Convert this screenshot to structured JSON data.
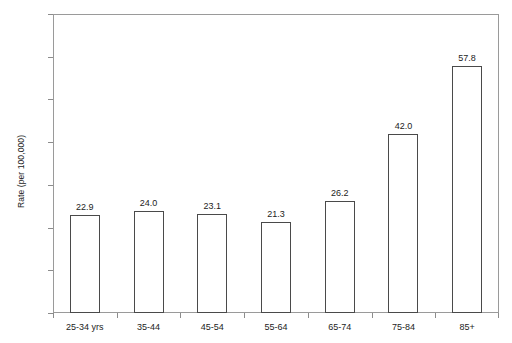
{
  "chart_data": {
    "type": "bar",
    "title": "",
    "xlabel": "",
    "ylabel": "Rate (per 100,000)",
    "categories": [
      "25-34 yrs",
      "35-44",
      "45-54",
      "55-64",
      "65-74",
      "75-84",
      "85+"
    ],
    "values": [
      22.9,
      24.0,
      23.1,
      21.3,
      26.2,
      42.0,
      57.8
    ],
    "value_labels": [
      "22.9",
      "24.0",
      "23.1",
      "21.3",
      "26.2",
      "42.0",
      "57.8"
    ],
    "ylim": [
      0.0,
      70.0
    ],
    "ytick_values": [
      0.0,
      10.0,
      20.0,
      30.0,
      40.0,
      50.0,
      60.0,
      70.0
    ],
    "ytick_labels": [
      "0.0",
      "10.0",
      "20.0",
      "30.0",
      "40.0",
      "50.0",
      "60.0",
      "70.0"
    ],
    "grid": false,
    "legend": false,
    "legend_position": "none",
    "bar_fill_color": "#ffffff",
    "bar_border_color": "#4a4a4a",
    "axis_color": "#9a9a9a",
    "text_color": "#1c1c1c",
    "background_color": "#ffffff"
  }
}
